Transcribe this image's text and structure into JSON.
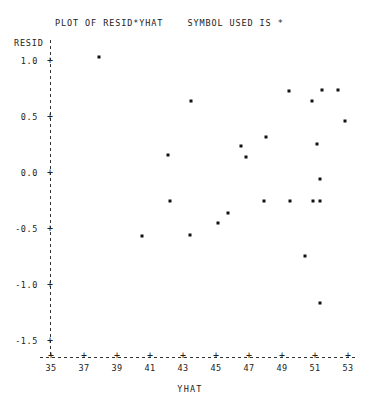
{
  "chart_data": {
    "type": "scatter",
    "title": "PLOT OF RESID*YHAT    SYMBOL USED IS *",
    "title_text": "PLOT OF RESID*YHAT    SYMBOL USED IS",
    "symbol": "*",
    "xlabel": "YHAT",
    "ylabel": "RESID",
    "xlim": [
      34.0,
      54.0
    ],
    "ylim": [
      -1.75,
      1.2
    ],
    "grid": false,
    "legend": "none",
    "xticks": [
      35,
      37,
      39,
      41,
      43,
      45,
      47,
      49,
      51,
      53
    ],
    "xtick_labels": [
      "35",
      "37",
      "39",
      "41",
      "43",
      "45",
      "47",
      "49",
      "51",
      "53"
    ],
    "yticks": [
      1.0,
      0.5,
      0.0,
      -0.5,
      -1.0,
      -1.5
    ],
    "ytick_labels": [
      "1.0",
      "0.5",
      "0.0",
      "-0.5",
      "-1.0",
      "-1.5"
    ],
    "tick_mark": "+",
    "n_points": 24,
    "x": [
      37.9,
      42.1,
      43.5,
      42.2,
      40.5,
      43.4,
      45.1,
      45.7,
      46.5,
      46.8,
      47.9,
      48.0,
      49.4,
      49.5,
      50.4,
      50.8,
      50.9,
      51.1,
      51.3,
      51.3,
      51.3,
      51.4,
      52.4,
      52.8
    ],
    "y": [
      1.04,
      0.16,
      0.64,
      -0.25,
      -0.56,
      -0.55,
      -0.45,
      -0.36,
      0.24,
      0.14,
      -0.25,
      0.32,
      0.73,
      -0.25,
      -0.74,
      0.64,
      -0.25,
      0.26,
      -0.05,
      -0.25,
      -1.16,
      0.74,
      0.74,
      0.46
    ],
    "points": [
      {
        "x": 37.9,
        "y": 1.04
      },
      {
        "x": 42.1,
        "y": 0.16
      },
      {
        "x": 43.5,
        "y": 0.64
      },
      {
        "x": 42.2,
        "y": -0.25
      },
      {
        "x": 40.5,
        "y": -0.56
      },
      {
        "x": 43.4,
        "y": -0.55
      },
      {
        "x": 45.1,
        "y": -0.45
      },
      {
        "x": 45.7,
        "y": -0.36
      },
      {
        "x": 46.5,
        "y": 0.24
      },
      {
        "x": 46.8,
        "y": 0.14
      },
      {
        "x": 47.9,
        "y": -0.25
      },
      {
        "x": 48.0,
        "y": 0.32
      },
      {
        "x": 49.4,
        "y": 0.73
      },
      {
        "x": 49.5,
        "y": -0.25
      },
      {
        "x": 50.4,
        "y": -0.74
      },
      {
        "x": 50.8,
        "y": 0.64
      },
      {
        "x": 50.9,
        "y": -0.25
      },
      {
        "x": 51.1,
        "y": 0.26
      },
      {
        "x": 51.3,
        "y": -0.05
      },
      {
        "x": 51.3,
        "y": -0.25
      },
      {
        "x": 51.3,
        "y": -1.16
      },
      {
        "x": 51.4,
        "y": 0.74
      },
      {
        "x": 52.4,
        "y": 0.74
      },
      {
        "x": 52.8,
        "y": 0.46
      }
    ]
  },
  "colors": {
    "point": "#111111",
    "axis": "#333333",
    "text": "#222222",
    "background": "#ffffff"
  }
}
